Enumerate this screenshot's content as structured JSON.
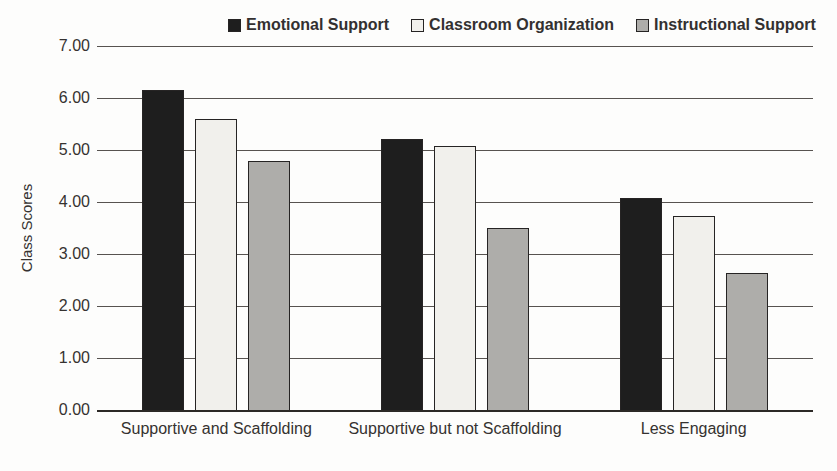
{
  "chart_data": {
    "type": "bar",
    "title": "",
    "xlabel": "",
    "ylabel": "Class Scores",
    "ylim": [
      0,
      7
    ],
    "grid": true,
    "legend_position": "top",
    "y_tick_labels": [
      "7.00",
      "6.00",
      "5.00",
      "4.00",
      "3.00",
      "2.00",
      "1.00",
      "0.00"
    ],
    "categories": [
      "Supportive and Scaffolding",
      "Supportive but not Scaffolding",
      "Less Engaging"
    ],
    "series": [
      {
        "name": "Emotional Support",
        "color": "#1e1e1e",
        "values": [
          6.15,
          5.21,
          4.07
        ]
      },
      {
        "name": "Classroom Organization",
        "color": "#f1f0ec",
        "values": [
          5.6,
          5.08,
          3.74
        ]
      },
      {
        "name": "Instructional Support",
        "color": "#aeadaa",
        "values": [
          4.78,
          3.5,
          2.63
        ]
      }
    ],
    "colors": {
      "bar_border": "#262424",
      "gridline": "#575350",
      "axis_line": "#2c2926",
      "text": "#353230"
    }
  }
}
